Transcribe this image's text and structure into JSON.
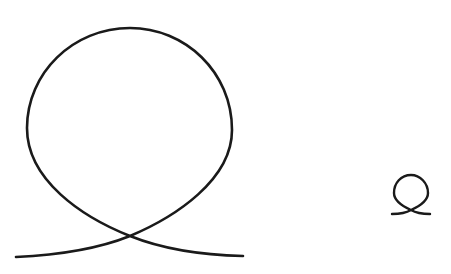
{
  "figure": {
    "stroke_color": "#1a1a1a",
    "background": "#ffffff",
    "shapes": [
      {
        "name": "large-loop",
        "size": "large"
      },
      {
        "name": "small-loop",
        "size": "small"
      }
    ]
  }
}
